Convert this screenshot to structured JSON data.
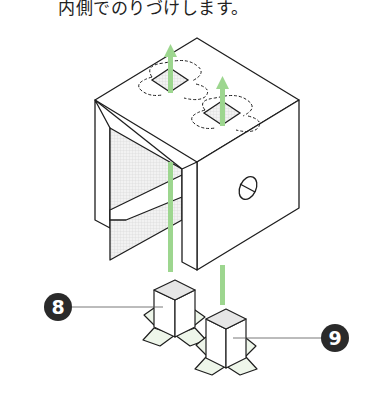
{
  "caption": "内側でのりづけします。",
  "colors": {
    "line": "#1e1e1e",
    "arrow": "#9dd68f",
    "shade": "#e6e6e6",
    "badge": "#2a2a2a",
    "leaf": "#eef6ea"
  },
  "callouts": [
    {
      "number": "8",
      "label_for": "left-post-part"
    },
    {
      "number": "9",
      "label_for": "right-post-part"
    }
  ]
}
